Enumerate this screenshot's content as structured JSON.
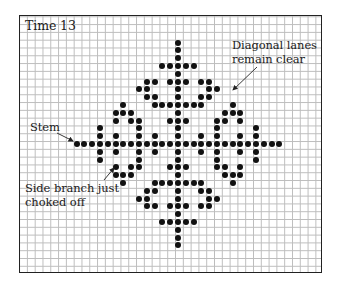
{
  "figure": {
    "title": "Time 13",
    "annotations": {
      "stem": {
        "text": "Stem",
        "x": 30,
        "y": 121
      },
      "diagonal": {
        "lines": [
          "Diagonal lanes",
          "remain clear"
        ],
        "x": 232,
        "y": 39
      },
      "side_branch": {
        "lines": [
          "Side branch just",
          "choked off"
        ],
        "x": 25,
        "y": 182
      }
    },
    "arrows": [
      {
        "name": "stem-arrow",
        "x1": 57,
        "y1": 133,
        "x2": 73,
        "y2": 141
      },
      {
        "name": "diagonal-arrow",
        "x1": 257,
        "y1": 67,
        "x2": 233,
        "y2": 90
      },
      {
        "name": "side-branch-arrow",
        "x1": 104,
        "y1": 180,
        "x2": 114,
        "y2": 168
      }
    ],
    "grid": {
      "center_x": 178,
      "center_y": 144,
      "cell": 7.8
    },
    "colors": {
      "dot": "#111111",
      "grid_line": "#bdbdbd",
      "frame": "#222222"
    },
    "quadrant_cells": [
      [
        0,
        -13
      ],
      [
        0,
        -12
      ],
      [
        0,
        -11
      ],
      [
        -2,
        -10
      ],
      [
        -1,
        -10
      ],
      [
        0,
        -10
      ],
      [
        0,
        -9
      ],
      [
        -4,
        -8
      ],
      [
        -3,
        -8
      ],
      [
        -1,
        -8
      ],
      [
        0,
        -8
      ],
      [
        -5,
        -7
      ],
      [
        -4,
        -7
      ],
      [
        0,
        -7
      ],
      [
        -4,
        -6
      ],
      [
        -3,
        -6
      ],
      [
        0,
        -6
      ],
      [
        -7,
        -5
      ],
      [
        -3,
        -5
      ],
      [
        -2,
        -5
      ],
      [
        -1,
        -5
      ],
      [
        0,
        -5
      ],
      [
        -8,
        -4
      ],
      [
        -7,
        -4
      ],
      [
        -6,
        -4
      ],
      [
        0,
        -4
      ],
      [
        -8,
        -3
      ],
      [
        -6,
        -3
      ],
      [
        -5,
        -3
      ],
      [
        -1,
        -3
      ],
      [
        0,
        -3
      ],
      [
        -10,
        -2
      ],
      [
        -5,
        -2
      ],
      [
        0,
        -2
      ],
      [
        -10,
        -1
      ],
      [
        -8,
        -1
      ],
      [
        -5,
        -1
      ],
      [
        -3,
        -1
      ],
      [
        0,
        -1
      ]
    ],
    "stem_half_length": 13,
    "symmetry": "four-fold (mirror across both axes)"
  }
}
